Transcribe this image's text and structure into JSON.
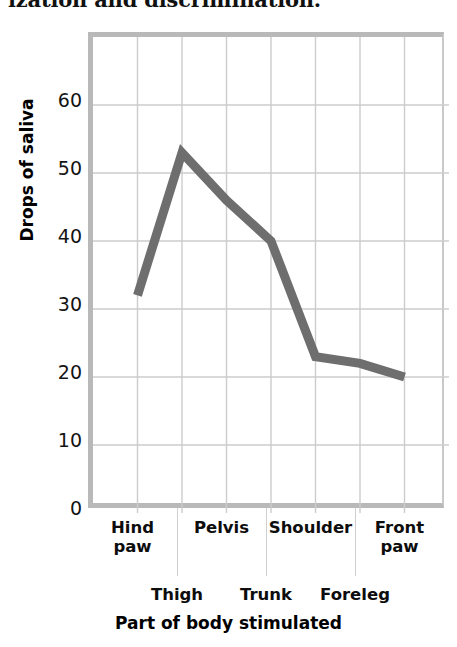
{
  "top_text": {
    "clipped_line": "ization and discrimination."
  },
  "chart_data": {
    "type": "line",
    "title": "",
    "xlabel": "Part of body stimulated",
    "ylabel": "Drops of saliva",
    "categories": [
      "Hind paw",
      "Thigh",
      "Pelvis",
      "Trunk",
      "Shoulder",
      "Foreleg",
      "Front paw"
    ],
    "values": [
      32,
      53,
      46,
      40,
      23,
      22,
      20
    ],
    "ylim": [
      0,
      70
    ],
    "yticks": [
      0,
      10,
      20,
      30,
      40,
      50,
      60
    ],
    "ytick_labels": [
      "0",
      "10",
      "20",
      "30",
      "40",
      "50",
      "60"
    ],
    "grid": true,
    "legend": "none",
    "series": [
      {
        "name": "Drops of saliva",
        "values": [
          32,
          53,
          46,
          40,
          23,
          22,
          20
        ],
        "color": "#6e6e6e",
        "line_width": 9
      }
    ],
    "category_rows": [
      {
        "row": 1,
        "label": "Hind\npaw",
        "category_index": 0
      },
      {
        "row": 2,
        "label": "Thigh",
        "category_index": 1
      },
      {
        "row": 1,
        "label": "Pelvis",
        "category_index": 2
      },
      {
        "row": 2,
        "label": "Trunk",
        "category_index": 3
      },
      {
        "row": 1,
        "label": "Shoulder",
        "category_index": 4
      },
      {
        "row": 2,
        "label": "Foreleg",
        "category_index": 5
      },
      {
        "row": 1,
        "label": "Front\npaw",
        "category_index": 6
      }
    ],
    "colors": {
      "line": "#6e6e6e",
      "grid": "#cccccc",
      "axis_border": "#b9b9b9",
      "text": "#141414",
      "background": "#ffffff"
    }
  }
}
